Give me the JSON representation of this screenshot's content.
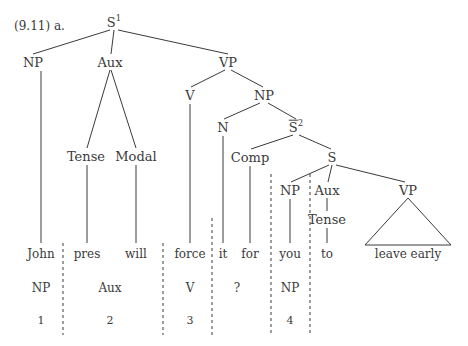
{
  "figure": {
    "example_label": "(9.11) a.",
    "caption_position": {
      "x": 14,
      "y": 26
    }
  },
  "tree": {
    "nodes": [
      {
        "id": "S1",
        "text": "S",
        "sup": "1",
        "overbar": false,
        "x": 114,
        "y": 22
      },
      {
        "id": "NP-subj",
        "text": "NP",
        "sup": "",
        "overbar": false,
        "x": 33,
        "y": 62
      },
      {
        "id": "Aux-main",
        "text": "Aux",
        "sup": "",
        "overbar": false,
        "x": 110,
        "y": 62
      },
      {
        "id": "VP-main",
        "text": "VP",
        "sup": "",
        "overbar": false,
        "x": 228,
        "y": 62
      },
      {
        "id": "Tense-1",
        "text": "Tense",
        "sup": "",
        "overbar": false,
        "x": 86,
        "y": 156
      },
      {
        "id": "Modal",
        "text": "Modal",
        "sup": "",
        "overbar": false,
        "x": 136,
        "y": 156
      },
      {
        "id": "V",
        "text": "V",
        "sup": "",
        "overbar": false,
        "x": 190,
        "y": 95
      },
      {
        "id": "NP-obj",
        "text": "NP",
        "sup": "",
        "overbar": false,
        "x": 264,
        "y": 95
      },
      {
        "id": "N",
        "text": "N",
        "sup": "",
        "overbar": false,
        "x": 223,
        "y": 127
      },
      {
        "id": "Sbar2",
        "text": "S",
        "sup": "2",
        "overbar": true,
        "x": 296,
        "y": 127
      },
      {
        "id": "Comp",
        "text": "Comp",
        "sup": "",
        "overbar": false,
        "x": 250,
        "y": 157
      },
      {
        "id": "S-emb",
        "text": "S",
        "sup": "",
        "overbar": false,
        "x": 332,
        "y": 157
      },
      {
        "id": "NP-emb",
        "text": "NP",
        "sup": "",
        "overbar": false,
        "x": 290,
        "y": 190
      },
      {
        "id": "Aux-emb",
        "text": "Aux",
        "sup": "",
        "overbar": false,
        "x": 327,
        "y": 190
      },
      {
        "id": "VP-emb",
        "text": "VP",
        "sup": "",
        "overbar": false,
        "x": 408,
        "y": 190
      },
      {
        "id": "Tense-2",
        "text": "Tense",
        "sup": "",
        "overbar": false,
        "x": 327,
        "y": 219
      }
    ],
    "edges": [
      {
        "from": "S1",
        "to": "NP-subj",
        "x1": 110,
        "y1": 30,
        "x2": 33,
        "y2": 54
      },
      {
        "from": "S1",
        "to": "Aux-main",
        "x1": 114,
        "y1": 30,
        "x2": 111,
        "y2": 54
      },
      {
        "from": "S1",
        "to": "VP-main",
        "x1": 118,
        "y1": 30,
        "x2": 228,
        "y2": 54
      },
      {
        "from": "Aux-main",
        "to": "Tense-1",
        "x1": 110,
        "y1": 70,
        "x2": 87,
        "y2": 148
      },
      {
        "from": "Aux-main",
        "to": "Modal",
        "x1": 111,
        "y1": 70,
        "x2": 136,
        "y2": 148
      },
      {
        "from": "VP-main",
        "to": "V",
        "x1": 225,
        "y1": 70,
        "x2": 191,
        "y2": 87
      },
      {
        "from": "VP-main",
        "to": "NP-obj",
        "x1": 231,
        "y1": 70,
        "x2": 263,
        "y2": 87
      },
      {
        "from": "NP-obj",
        "to": "N",
        "x1": 260,
        "y1": 103,
        "x2": 224,
        "y2": 119
      },
      {
        "from": "NP-obj",
        "to": "Sbar2",
        "x1": 268,
        "y1": 103,
        "x2": 296,
        "y2": 119
      },
      {
        "from": "Sbar2",
        "to": "Comp",
        "x1": 293,
        "y1": 135,
        "x2": 251,
        "y2": 149
      },
      {
        "from": "Sbar2",
        "to": "S-emb",
        "x1": 299,
        "y1": 135,
        "x2": 331,
        "y2": 149
      },
      {
        "from": "S-emb",
        "to": "NP-emb",
        "x1": 329,
        "y1": 165,
        "x2": 291,
        "y2": 182
      },
      {
        "from": "S-emb",
        "to": "Aux-emb",
        "x1": 332,
        "y1": 165,
        "x2": 328,
        "y2": 182
      },
      {
        "from": "S-emb",
        "to": "VP-emb",
        "x1": 336,
        "y1": 165,
        "x2": 405,
        "y2": 182
      },
      {
        "from": "Aux-emb",
        "to": "Tense-2",
        "x1": 327,
        "y1": 198,
        "x2": 327,
        "y2": 211
      }
    ],
    "stems": [
      {
        "node": "NP-subj",
        "word": "John",
        "x": 41,
        "y1": 71,
        "y2": 243
      },
      {
        "node": "Tense-1",
        "word": "pres",
        "x": 87,
        "y1": 165,
        "y2": 243
      },
      {
        "node": "Modal",
        "word": "will",
        "x": 136,
        "y1": 165,
        "y2": 243
      },
      {
        "node": "V",
        "word": "force",
        "x": 190,
        "y1": 104,
        "y2": 243
      },
      {
        "node": "N",
        "word": "it",
        "x": 223,
        "y1": 136,
        "y2": 243
      },
      {
        "node": "Comp",
        "word": "for",
        "x": 250,
        "y1": 166,
        "y2": 243
      },
      {
        "node": "NP-emb",
        "word": "you",
        "x": 290,
        "y1": 199,
        "y2": 243
      },
      {
        "node": "Tense-2",
        "word": "to",
        "x": 327,
        "y1": 228,
        "y2": 243
      }
    ],
    "triangle": {
      "node": "VP-emb",
      "label": "leave early",
      "apex_x": 408,
      "apex_y": 198,
      "left_x": 365,
      "right_x": 451,
      "base_y": 245
    }
  },
  "terminals": [
    {
      "word": "John",
      "x": 41,
      "y": 254
    },
    {
      "word": "pres",
      "x": 87,
      "y": 254
    },
    {
      "word": "will",
      "x": 136,
      "y": 254
    },
    {
      "word": "force",
      "x": 190,
      "y": 254
    },
    {
      "word": "it",
      "x": 223,
      "y": 254
    },
    {
      "word": "for",
      "x": 250,
      "y": 254
    },
    {
      "word": "you",
      "x": 290,
      "y": 254
    },
    {
      "word": "to",
      "x": 327,
      "y": 254
    },
    {
      "word": "leave early",
      "x": 408,
      "y": 254
    }
  ],
  "categories": [
    {
      "label": "NP",
      "x": 41,
      "y": 288
    },
    {
      "label": "Aux",
      "x": 110,
      "y": 288
    },
    {
      "label": "V",
      "x": 190,
      "y": 288
    },
    {
      "label": "?",
      "x": 237,
      "y": 288
    },
    {
      "label": "NP",
      "x": 290,
      "y": 288
    }
  ],
  "numbers": [
    {
      "label": "1",
      "x": 41,
      "y": 320
    },
    {
      "label": "2",
      "x": 110,
      "y": 320
    },
    {
      "label": "3",
      "x": 190,
      "y": 320
    },
    {
      "label": "4",
      "x": 290,
      "y": 320
    }
  ],
  "separators": [
    {
      "id": "sep-1",
      "x": 63,
      "y1": 243,
      "y2": 335
    },
    {
      "id": "sep-2",
      "x": 163,
      "y1": 243,
      "y2": 335
    },
    {
      "id": "sep-3",
      "x": 212,
      "y1": 218,
      "y2": 335
    },
    {
      "id": "sep-4",
      "x": 271,
      "y1": 174,
      "y2": 335
    },
    {
      "id": "sep-5",
      "x": 310,
      "y1": 174,
      "y2": 335
    }
  ],
  "style": {
    "line_color": "#3a3a3a",
    "text_color": "#3a3a3a",
    "background": "#ffffff"
  }
}
